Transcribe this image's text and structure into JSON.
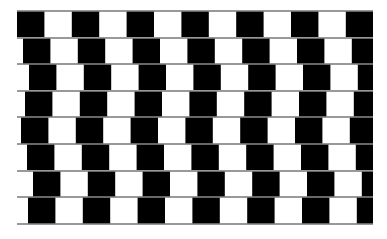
{
  "figure": {
    "name": "cafe-wall-illusion",
    "background_color": "#ffffff",
    "tile_dark_color": "#000000",
    "tile_light_color": "#ffffff",
    "mortar_color": "#808080",
    "canvas_width": 387,
    "canvas_height": 239
  },
  "pattern": {
    "type": "cafe-wall",
    "origin_x": 17,
    "origin_y": 11,
    "pattern_width": 356,
    "pattern_height": 213,
    "row_count": 8,
    "tile_width": 27.4,
    "row_height": 26.6,
    "tiles_per_row": 13,
    "mortar_thickness": 1.6,
    "row_offsets_px": [
      0,
      6,
      12,
      8,
      4,
      10,
      16,
      11
    ],
    "rows": [
      {
        "index": 1,
        "y_top": 11,
        "y_bottom": 37,
        "offset_px": 0
      },
      {
        "index": 2,
        "y_top": 38,
        "y_bottom": 64,
        "offset_px": 6
      },
      {
        "index": 3,
        "y_top": 64,
        "y_bottom": 90,
        "offset_px": 12
      },
      {
        "index": 4,
        "y_top": 91,
        "y_bottom": 117,
        "offset_px": 8
      },
      {
        "index": 5,
        "y_top": 117,
        "y_bottom": 144,
        "offset_px": 4
      },
      {
        "index": 6,
        "y_top": 144,
        "y_bottom": 170,
        "offset_px": 10
      },
      {
        "index": 7,
        "y_top": 171,
        "y_bottom": 197,
        "offset_px": 16
      },
      {
        "index": 8,
        "y_top": 197,
        "y_bottom": 224,
        "offset_px": 11
      }
    ]
  }
}
